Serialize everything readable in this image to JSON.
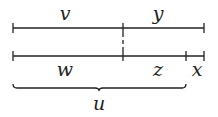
{
  "diagram": {
    "segments_top": [
      {
        "label": "v"
      },
      {
        "label": "y"
      }
    ],
    "segments_bottom": [
      {
        "label": "w"
      },
      {
        "label": "z"
      },
      {
        "label": "x"
      }
    ],
    "brace": {
      "label": "u"
    },
    "stroke_color": "#222222"
  }
}
